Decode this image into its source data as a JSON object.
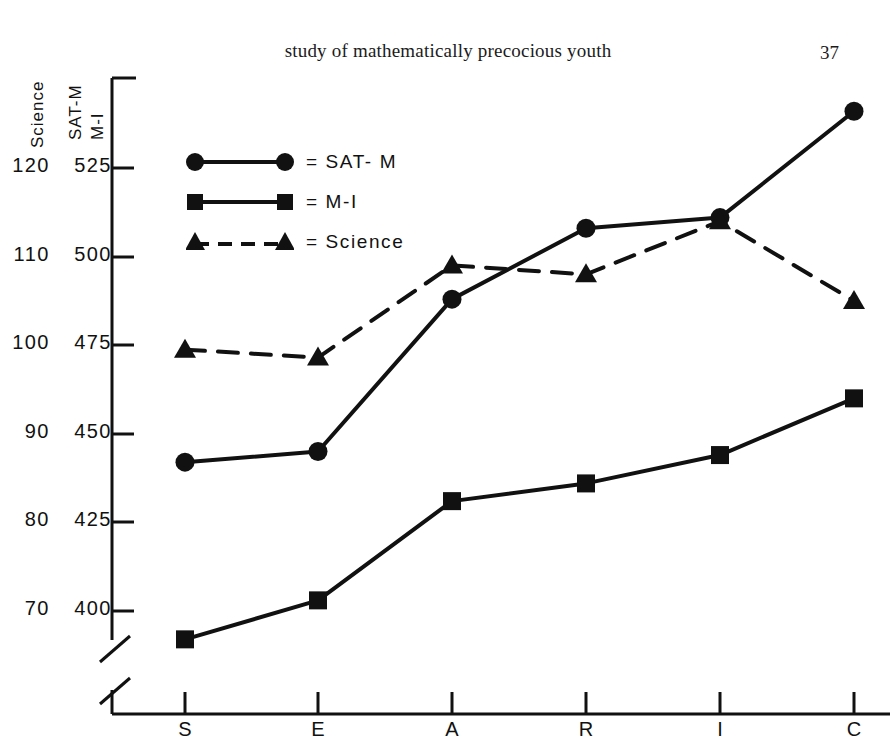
{
  "page": {
    "running_head": "study of mathematically precocious youth",
    "folio": "37"
  },
  "chart_data": {
    "type": "line",
    "title": "",
    "xlabel": "",
    "ylabel": "SAT-M  M-I",
    "secondary_ylabel": "Science",
    "categories": [
      "S",
      "E",
      "A",
      "R",
      "I",
      "C"
    ],
    "grid": false,
    "legend_position": "upper-left-inside",
    "axis_break": true,
    "axes": {
      "left_primary": {
        "name": "SAT-M / M-I",
        "ticks": [
          "525",
          "500",
          "475",
          "450",
          "425",
          "400"
        ],
        "values": [
          525,
          500,
          475,
          450,
          425,
          400
        ],
        "ylim": [
          400,
          525
        ]
      },
      "left_secondary": {
        "name": "Science",
        "ticks": [
          "120",
          "110",
          "100",
          "90",
          "80",
          "70"
        ],
        "values": [
          120,
          110,
          100,
          90,
          80,
          70
        ],
        "ylim": [
          70,
          120
        ]
      }
    },
    "series": [
      {
        "name": "SAT-M",
        "legend_label": "= SAT- M",
        "marker": "circle",
        "line": "solid",
        "axis": "left_primary",
        "values": [
          442,
          445,
          488,
          508,
          511,
          541
        ]
      },
      {
        "name": "M-I",
        "legend_label": "= M-I",
        "marker": "square",
        "line": "solid",
        "axis": "left_primary",
        "values": [
          392,
          403,
          431,
          436,
          444,
          460
        ]
      },
      {
        "name": "Science",
        "legend_label": "= Science",
        "marker": "triangle",
        "line": "dashed",
        "axis": "left_secondary",
        "values": [
          99.5,
          98.6,
          109.0,
          108.0,
          114.0,
          105.0
        ]
      }
    ],
    "colors": {
      "ink": "#111111",
      "background": "#ffffff"
    }
  }
}
